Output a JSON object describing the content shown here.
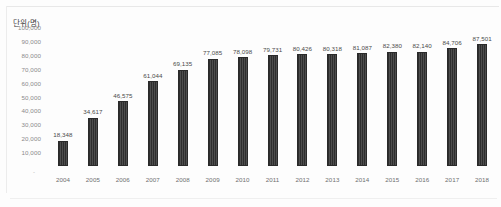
{
  "chart_data": {
    "type": "bar",
    "title": "",
    "subtitle": "",
    "unit_label": "단위(명)",
    "xlabel": "",
    "ylabel": "",
    "ylim": [
      0,
      100000
    ],
    "ytick_step": 10000,
    "grid": false,
    "legend": false,
    "bar_color": "#3a3a3a",
    "categories": [
      "2004",
      "2005",
      "2006",
      "2007",
      "2008",
      "2009",
      "2010",
      "2011",
      "2012",
      "2013",
      "2014",
      "2015",
      "2016",
      "2017",
      "2018"
    ],
    "values": [
      18348,
      34617,
      46575,
      61044,
      69135,
      77085,
      78098,
      79731,
      80426,
      80318,
      81087,
      82380,
      82140,
      84706,
      87501
    ],
    "value_labels": [
      "18,348",
      "34,617",
      "46,575",
      "61,044",
      "69,135",
      "77,085",
      "78,098",
      "79,731",
      "80,426",
      "80,318",
      "81,087",
      "82,380",
      "82,140",
      "84,706",
      "87,501"
    ],
    "ytick_labels": [
      "100,000",
      "90,000",
      "80,000",
      "70,000",
      "60,000",
      "50,000",
      "40,000",
      "30,000",
      "20,000",
      "10,000"
    ],
    "ytick_values": [
      100000,
      90000,
      80000,
      70000,
      60000,
      50000,
      40000,
      30000,
      20000,
      10000
    ],
    "zero_mark": "-"
  }
}
